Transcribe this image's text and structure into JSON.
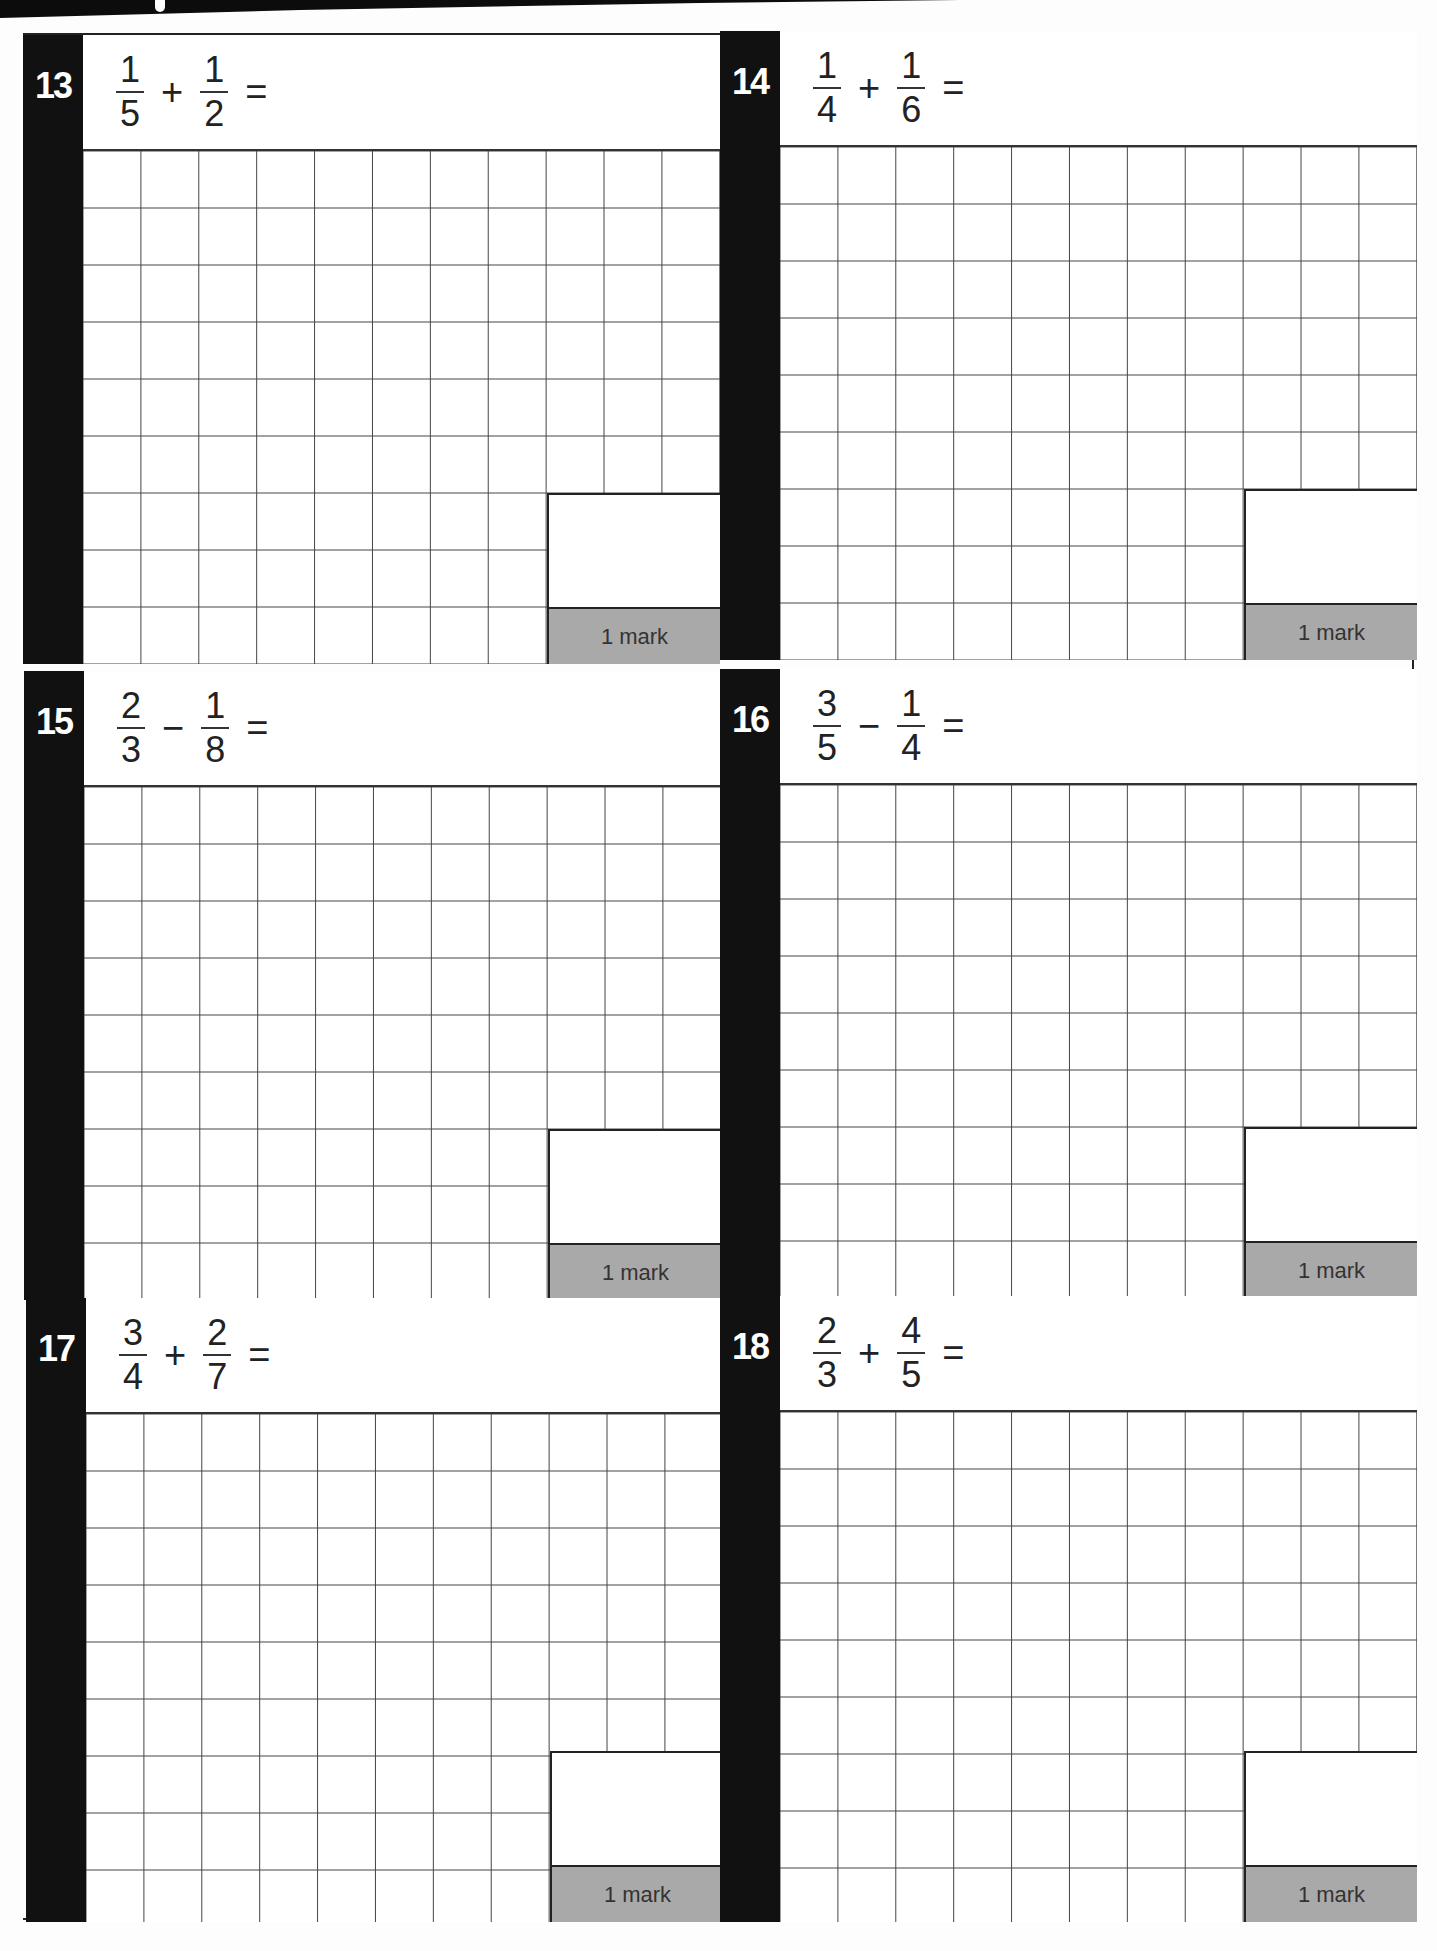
{
  "page": {
    "banner_color": "#0c0c0c",
    "bar_color": "#111111",
    "mark_band_color": "#a9a9a9"
  },
  "questions": [
    {
      "number": "13",
      "a_num": "1",
      "a_den": "5",
      "op": "+",
      "b_num": "1",
      "b_den": "2",
      "equals": "=",
      "marks": "1 mark"
    },
    {
      "number": "14",
      "a_num": "1",
      "a_den": "4",
      "op": "+",
      "b_num": "1",
      "b_den": "6",
      "equals": "=",
      "marks": "1 mark"
    },
    {
      "number": "15",
      "a_num": "2",
      "a_den": "3",
      "op": "−",
      "b_num": "1",
      "b_den": "8",
      "equals": "=",
      "marks": "1 mark"
    },
    {
      "number": "16",
      "a_num": "3",
      "a_den": "5",
      "op": "−",
      "b_num": "1",
      "b_den": "4",
      "equals": "=",
      "marks": "1 mark"
    },
    {
      "number": "17",
      "a_num": "3",
      "a_den": "4",
      "op": "+",
      "b_num": "2",
      "b_den": "7",
      "equals": "=",
      "marks": "1 mark"
    },
    {
      "number": "18",
      "a_num": "2",
      "a_den": "3",
      "op": "+",
      "b_num": "4",
      "b_den": "5",
      "equals": "=",
      "marks": "1 mark"
    }
  ]
}
